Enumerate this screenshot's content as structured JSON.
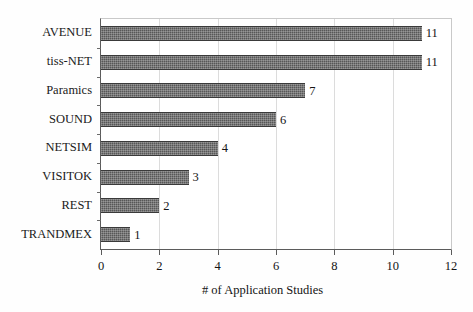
{
  "chart_data": {
    "type": "bar",
    "orientation": "horizontal",
    "title": "",
    "xlabel": "# of Application Studies",
    "ylabel": "",
    "categories": [
      "AVENUE",
      "tiss-NET",
      "Paramics",
      "SOUND",
      "NETSIM",
      "VISITOK",
      "REST",
      "TRANDMEX"
    ],
    "values": [
      11,
      11,
      7,
      6,
      4,
      3,
      2,
      1
    ],
    "value_labels": [
      "11",
      "11",
      "7",
      "6",
      "4",
      "3",
      "2",
      "1"
    ],
    "xlim": [
      0,
      12
    ],
    "xticks": [
      0,
      2,
      4,
      6,
      8,
      10,
      12
    ],
    "xtick_labels": [
      "0",
      "2",
      "4",
      "6",
      "8",
      "10",
      "12"
    ],
    "grid": "vertical-only",
    "legend": "none",
    "bar_color": "#575757",
    "bar_edge_color": "#3a3a3a",
    "gridline_color": "#dcdcdc",
    "axis_color": "#5b5b5b",
    "background_color": "#ffffff"
  }
}
